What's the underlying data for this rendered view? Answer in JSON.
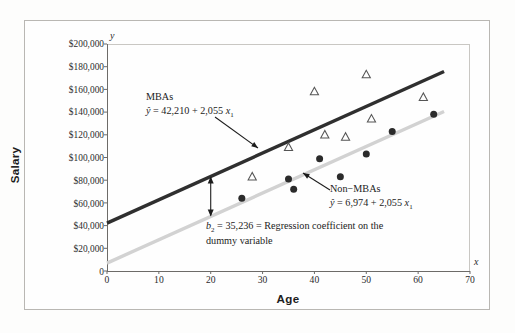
{
  "figure": {
    "y_axis_symbol": "y",
    "x_axis_symbol": "x",
    "y_axis_title": "Salary",
    "x_axis_title": "Age"
  },
  "annotations": {
    "mba_label": "MBAs",
    "mba_eq_lhs": "ŷ",
    "mba_eq_rhs": "= 42,210 + 2,055",
    "mba_eq_var": "x",
    "mba_eq_var_sub": "1",
    "nonmba_label": "Non−MBAs",
    "nonmba_eq_lhs": "ŷ",
    "nonmba_eq_rhs": "= 6,974 + 2,055",
    "nonmba_eq_var": "x",
    "nonmba_eq_var_sub": "1",
    "b2_sym": "b",
    "b2_sub": "2",
    "b2_line1": "= 35,236 = Regression coefficient on the",
    "b2_line2": "dummy variable"
  },
  "chart_data": {
    "type": "scatter",
    "title": "",
    "xlabel": "Age",
    "ylabel": "Salary",
    "xlim": [
      0,
      70
    ],
    "ylim": [
      0,
      200000
    ],
    "grid": false,
    "legend_position": "inline-annotations",
    "x_ticks": [
      0,
      10,
      20,
      30,
      40,
      50,
      60,
      70
    ],
    "x_tick_labels": [
      "0",
      "10",
      "20",
      "30",
      "40",
      "50",
      "60",
      "70"
    ],
    "y_ticks": [
      0,
      20000,
      40000,
      60000,
      80000,
      100000,
      120000,
      140000,
      160000,
      180000,
      200000
    ],
    "y_tick_labels": [
      "0",
      "$20,000",
      "$40,000",
      "$60,000",
      "$80,000",
      "$100,000",
      "$120,000",
      "$140,000",
      "$160,000",
      "$180,000",
      "$200,000"
    ],
    "series": [
      {
        "name": "MBAs",
        "marker": "open-triangle",
        "color": "#555555",
        "points": [
          {
            "x": 28,
            "y": 83000
          },
          {
            "x": 35,
            "y": 109000
          },
          {
            "x": 40,
            "y": 158000
          },
          {
            "x": 42,
            "y": 120000
          },
          {
            "x": 46,
            "y": 118000
          },
          {
            "x": 50,
            "y": 173000
          },
          {
            "x": 51,
            "y": 134000
          },
          {
            "x": 61,
            "y": 153000
          }
        ]
      },
      {
        "name": "Non-MBAs",
        "marker": "filled-circle",
        "color": "#2b2b2b",
        "points": [
          {
            "x": 26,
            "y": 64000
          },
          {
            "x": 35,
            "y": 81000
          },
          {
            "x": 36,
            "y": 72000
          },
          {
            "x": 41,
            "y": 99000
          },
          {
            "x": 45,
            "y": 83000
          },
          {
            "x": 50,
            "y": 103000
          },
          {
            "x": 55,
            "y": 123000
          },
          {
            "x": 63,
            "y": 138000
          }
        ]
      }
    ],
    "lines": [
      {
        "name": "MBAs regression line",
        "equation": "y-hat = 42,210 + 2,055 x1",
        "intercept": 42210,
        "slope": 2055,
        "x_start": 0,
        "x_end": 65,
        "color": "#2f2f2f",
        "width": 3.4
      },
      {
        "name": "Non-MBAs regression line",
        "equation": "y-hat = 6,974 + 2,055 x1",
        "intercept": 6974,
        "slope": 2055,
        "x_start": 0,
        "x_end": 65,
        "color": "#d2d2d2",
        "width": 3.4
      }
    ],
    "gap_annotation": {
      "label": "b2 = 35,236 = Regression coefficient on the dummy variable",
      "value": 35236,
      "at_x": 20
    }
  }
}
